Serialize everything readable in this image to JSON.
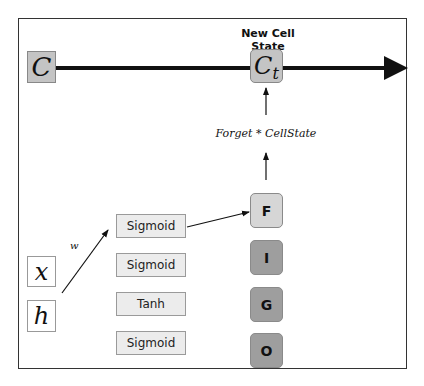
{
  "diagram": {
    "title": "New Cell State",
    "cell_state_input": "C",
    "cell_state_output": "C",
    "cell_state_output_subscript": "t",
    "operation_label": "Forget * CellState",
    "weight_label": "w",
    "inputs": [
      {
        "label": "x"
      },
      {
        "label": "h"
      }
    ],
    "activations": [
      {
        "label": "Sigmoid"
      },
      {
        "label": "Sigmoid"
      },
      {
        "label": "Tanh"
      },
      {
        "label": "Sigmoid"
      }
    ],
    "gates": [
      {
        "label": "F",
        "color": "#d6d6d6"
      },
      {
        "label": "I",
        "color": "#9e9e9e"
      },
      {
        "label": "G",
        "color": "#9e9e9e"
      },
      {
        "label": "O",
        "color": "#9e9e9e"
      }
    ],
    "colors": {
      "cell_box": "#c4c4c4",
      "activation_box": "#ececec",
      "forget_gate": "#d6d6d6",
      "other_gates": "#9e9e9e",
      "line": "#111111"
    }
  }
}
